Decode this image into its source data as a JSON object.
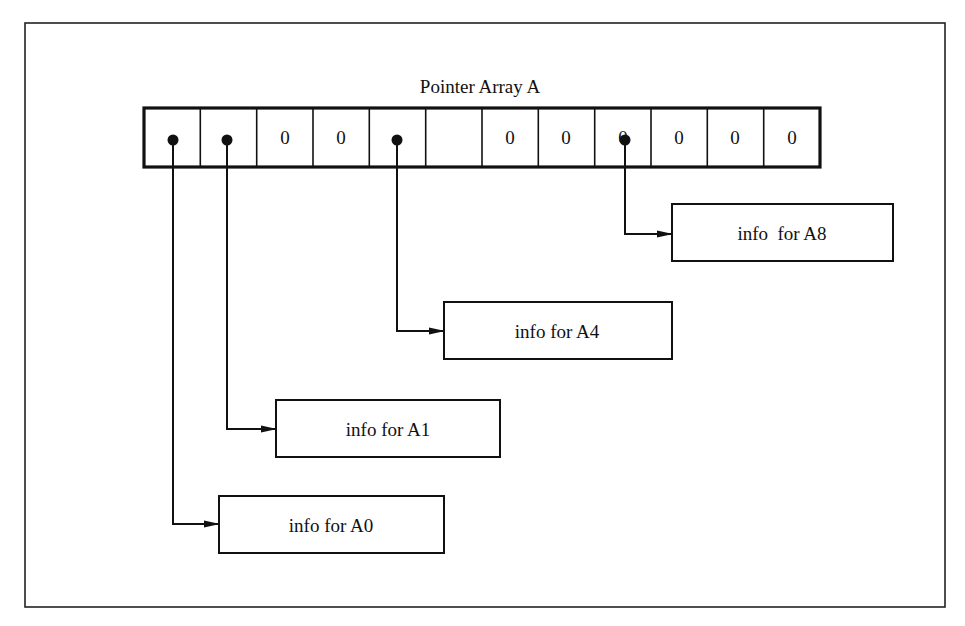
{
  "diagram": {
    "title": "Pointer Array A",
    "array": {
      "cells": [
        {
          "index": 0,
          "value": "pointer",
          "label": ""
        },
        {
          "index": 1,
          "value": "pointer",
          "label": ""
        },
        {
          "index": 2,
          "value": "0",
          "label": "0"
        },
        {
          "index": 3,
          "value": "0",
          "label": "0"
        },
        {
          "index": 4,
          "value": "pointer",
          "label": ""
        },
        {
          "index": 5,
          "value": "0",
          "label": "0"
        },
        {
          "index": 6,
          "value": "0",
          "label": "0"
        },
        {
          "index": 7,
          "value": "0",
          "label": "0"
        },
        {
          "index": 8,
          "value": "pointer",
          "label": ""
        },
        {
          "index": 9,
          "value": "0",
          "label": "0"
        },
        {
          "index": 10,
          "value": "0",
          "label": "0"
        },
        {
          "index": 11,
          "value": "0",
          "label": "0"
        }
      ]
    },
    "info_boxes": [
      {
        "target_index": 8,
        "label": "info  for A8"
      },
      {
        "target_index": 4,
        "label": "info for A4"
      },
      {
        "target_index": 1,
        "label": "info for A1"
      },
      {
        "target_index": 0,
        "label": "info for A0"
      }
    ],
    "colors": {
      "stroke": "#111111",
      "background": "#ffffff"
    }
  }
}
